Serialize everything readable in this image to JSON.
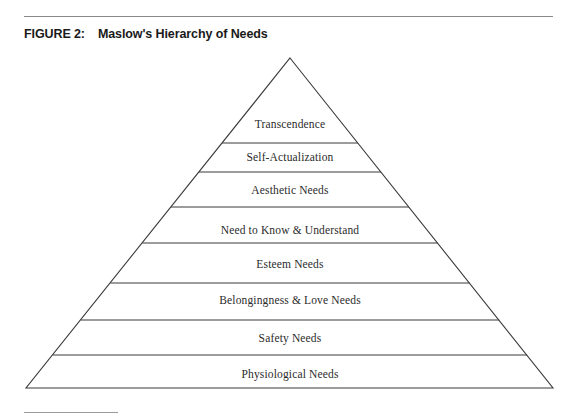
{
  "page": {
    "background_color": "#ffffff",
    "width": 577,
    "height": 420
  },
  "rules": {
    "top_rule_color": "#8a8a8e",
    "footnote_rule_color": "#9a9a9e"
  },
  "caption": {
    "figure_label": "FIGURE 2:",
    "figure_title": "Maslow's Hierarchy of Needs"
  },
  "chart_data": {
    "type": "pyramid",
    "title": "Maslow's Hierarchy of Needs",
    "xlabel": "",
    "ylabel": "",
    "grid": false,
    "legend": "none",
    "stroke_color": "#3a3a3a",
    "fill_color": "#ffffff",
    "apex": {
      "x": 290,
      "y": 58
    },
    "base_left": {
      "x": 26,
      "y": 388
    },
    "base_right": {
      "x": 553,
      "y": 388
    },
    "divider_y": [
      143,
      172,
      207,
      243,
      283,
      320,
      355
    ],
    "tiers": [
      {
        "rank": 1,
        "label": "Transcendence",
        "top_y": 58,
        "bottom_y": 143,
        "label_y": 124
      },
      {
        "rank": 2,
        "label": "Self-Actualization",
        "top_y": 143,
        "bottom_y": 172,
        "label_y": 157
      },
      {
        "rank": 3,
        "label": "Aesthetic Needs",
        "top_y": 172,
        "bottom_y": 207,
        "label_y": 190
      },
      {
        "rank": 4,
        "label": "Need to Know & Understand",
        "top_y": 207,
        "bottom_y": 243,
        "label_y": 230
      },
      {
        "rank": 5,
        "label": "Esteem Needs",
        "top_y": 243,
        "bottom_y": 283,
        "label_y": 264
      },
      {
        "rank": 6,
        "label": "Belongingness & Love Needs",
        "top_y": 283,
        "bottom_y": 320,
        "label_y": 300
      },
      {
        "rank": 7,
        "label": "Safety Needs",
        "top_y": 320,
        "bottom_y": 355,
        "label_y": 338
      },
      {
        "rank": 8,
        "label": "Physiological Needs",
        "top_y": 355,
        "bottom_y": 388,
        "label_y": 374
      }
    ]
  }
}
